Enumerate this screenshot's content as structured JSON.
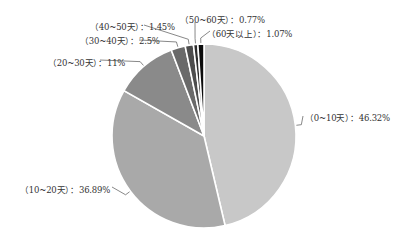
{
  "chart_data": {
    "type": "pie",
    "title": "",
    "categories": [
      "0~10天",
      "10~20天",
      "20~30天",
      "30~40天",
      "40~50天",
      "50~60天",
      "60天以上"
    ],
    "values": [
      46.32,
      36.89,
      11,
      2.5,
      1.45,
      0.77,
      1.07
    ],
    "unit": "%",
    "colors": [
      "#c8c8c8",
      "#a9a9a9",
      "#8a8a8a",
      "#6a6a6a",
      "#4d4d4d",
      "#2e2e2e",
      "#0c0c0c"
    ],
    "labels": [
      "（0~10天）：46.32%",
      "（10~20天）：36.89%",
      "（20~30天）：11%",
      "（30~40天）：2.5%",
      "（40~50天）：1.45%",
      "（50~60天）：0.77%",
      "（60天以上）：1.07%"
    ],
    "start_angle_deg": 0,
    "direction": "clockwise",
    "legend": "none"
  }
}
